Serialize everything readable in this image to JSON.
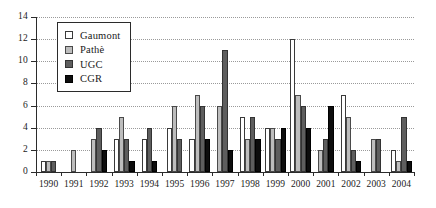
{
  "chart_data": {
    "type": "bar",
    "title": "",
    "subtitle": "",
    "xlabel": "",
    "ylabel": "",
    "ylim": [
      0,
      14
    ],
    "ytick_step": 2,
    "ytick_labels": [
      "0",
      "2",
      "4",
      "6",
      "8",
      "10",
      "12",
      "14"
    ],
    "grid": true,
    "grid_axis": "y",
    "legend_position": "top-left",
    "categories": [
      "1990",
      "1991",
      "1992",
      "1993",
      "1994",
      "1995",
      "1996",
      "1997",
      "1998",
      "1999",
      "2000",
      "2001",
      "2002",
      "2003",
      "2004"
    ],
    "series": [
      {
        "name": "Gaumont",
        "color": "#ffffff",
        "values": [
          1,
          0,
          0,
          3,
          3,
          4,
          3,
          0,
          5,
          4,
          12,
          0,
          7,
          0,
          2
        ]
      },
      {
        "name": "Pathè",
        "color": "#bdbdbd",
        "values": [
          1,
          2,
          3,
          5,
          0,
          6,
          7,
          6,
          3,
          4,
          7,
          2,
          5,
          3,
          1
        ]
      },
      {
        "name": "UGC",
        "color": "#5e5e5e",
        "values": [
          1,
          0,
          4,
          3,
          4,
          3,
          6,
          11,
          5,
          3,
          6,
          3,
          2,
          3,
          5
        ]
      },
      {
        "name": "CGR",
        "color": "#0d0d0d",
        "values": [
          0,
          0,
          2,
          1,
          1,
          0,
          3,
          2,
          3,
          4,
          4,
          6,
          1,
          0,
          1
        ]
      }
    ]
  },
  "legend": {
    "items": [
      {
        "label": "Gaumont",
        "swatch": "gaumont"
      },
      {
        "label": "Pathè",
        "swatch": "pathe"
      },
      {
        "label": "UGC",
        "swatch": "ugc"
      },
      {
        "label": "CGR",
        "swatch": "cgr"
      }
    ]
  }
}
